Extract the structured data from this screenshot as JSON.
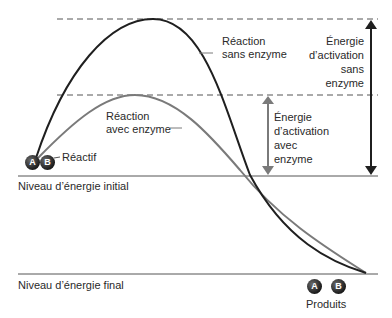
{
  "diagram": {
    "title": "",
    "curves": {
      "without_enzyme": {
        "label_line1": "Réaction",
        "label_line2": "sans enzyme",
        "color": "#1f1f1f"
      },
      "with_enzyme": {
        "label_line1": "Réaction",
        "label_line2": "avec enzyme",
        "color": "#7a7a7a"
      }
    },
    "arrows": {
      "without_enzyme": {
        "line1": "Énergie",
        "line2": "d’activation",
        "line3": "sans",
        "line4": "enzyme",
        "color": "#1f1f1f"
      },
      "with_enzyme": {
        "line1": "Énergie",
        "line2": "d’activation",
        "line3": "avec",
        "line4": "enzyme",
        "color": "#7a7a7a"
      }
    },
    "levels": {
      "initial": "Niveau d’énergie initial",
      "final": "Niveau d’énergie final"
    },
    "reactant": {
      "label": "Réactif",
      "molecules": [
        "A",
        "B"
      ]
    },
    "products": {
      "label": "Produits",
      "molecules": [
        "A",
        "B"
      ]
    }
  }
}
